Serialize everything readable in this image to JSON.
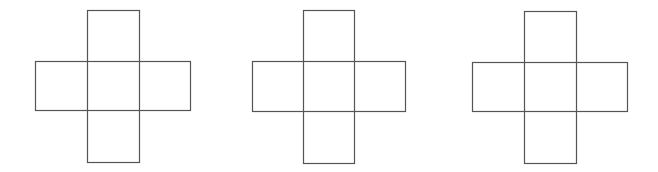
{
  "diagram": {
    "type": "cube-nets",
    "stroke_color": "#555555",
    "background": "#ffffff",
    "nets": [
      {
        "name": "cross-net-1",
        "vbar": {
          "x": 87,
          "y": 10,
          "w": 52,
          "h": 152
        },
        "hbar": {
          "x": 35,
          "y": 61,
          "w": 155,
          "h": 49
        }
      },
      {
        "name": "cross-net-2",
        "vbar": {
          "x": 303,
          "y": 10,
          "w": 51,
          "h": 153
        },
        "hbar": {
          "x": 252,
          "y": 61,
          "w": 153,
          "h": 50
        }
      },
      {
        "name": "cross-net-3",
        "vbar": {
          "x": 524,
          "y": 11,
          "w": 52,
          "h": 152
        },
        "hbar": {
          "x": 472,
          "y": 62,
          "w": 155,
          "h": 49
        }
      }
    ]
  }
}
